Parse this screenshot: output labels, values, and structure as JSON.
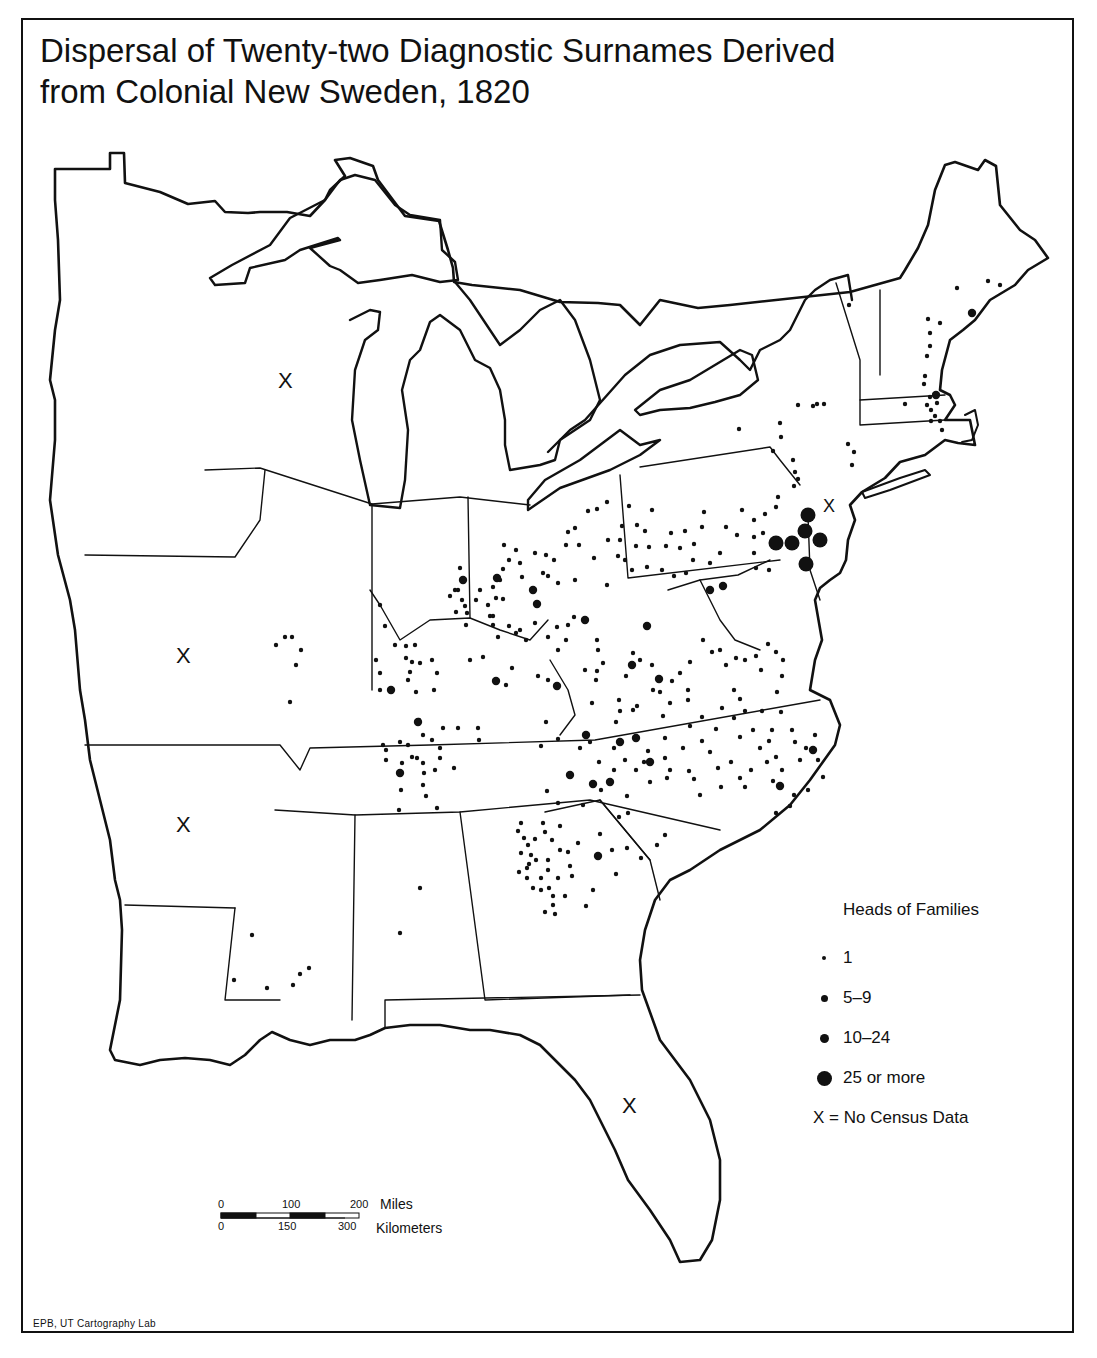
{
  "title": {
    "line1": "Dispersal of Twenty-two Diagnostic Surnames Derived",
    "line2": "from Colonial New Sweden, 1820"
  },
  "legend": {
    "title": "Heads of Families",
    "items": [
      {
        "label": "1",
        "size": 4
      },
      {
        "label": "5–9",
        "size": 7
      },
      {
        "label": "10–24",
        "size": 9
      },
      {
        "label": "25 or more",
        "size": 15
      }
    ],
    "no_data_note": "X = No Census Data"
  },
  "no_data_marker": "X",
  "no_data_regions": [
    {
      "name": "michigan-territory-west",
      "x": 286,
      "y": 381
    },
    {
      "name": "missouri",
      "x": 184,
      "y": 655
    },
    {
      "name": "arkansas-territory",
      "x": 184,
      "y": 824
    },
    {
      "name": "new-jersey",
      "x": 830,
      "y": 508
    },
    {
      "name": "florida",
      "x": 630,
      "y": 1105
    }
  ],
  "scale_bar": {
    "miles_ticks": [
      "0",
      "100",
      "200"
    ],
    "miles_label": "Miles",
    "km_ticks": [
      "0",
      "150",
      "300"
    ],
    "km_label": "Kilometers"
  },
  "credit": "EPB, UT Cartography Lab",
  "colors": {
    "ink": "#111111",
    "paper": "#ffffff"
  },
  "dots": {
    "large": [
      [
        805,
        531
      ],
      [
        820,
        540
      ],
      [
        806,
        564
      ],
      [
        792,
        543
      ],
      [
        776,
        543
      ],
      [
        808,
        515
      ]
    ],
    "medium": [
      [
        463,
        580
      ],
      [
        537,
        604
      ],
      [
        557,
        686
      ],
      [
        496,
        681
      ],
      [
        391,
        690
      ],
      [
        418,
        722
      ],
      [
        400,
        773
      ],
      [
        586,
        735
      ],
      [
        570,
        775
      ],
      [
        593,
        784
      ],
      [
        598,
        856
      ],
      [
        636,
        738
      ],
      [
        620,
        742
      ],
      [
        650,
        762
      ],
      [
        659,
        679
      ],
      [
        632,
        665
      ],
      [
        710,
        590
      ],
      [
        723,
        586
      ],
      [
        533,
        590
      ],
      [
        780,
        786
      ],
      [
        813,
        750
      ],
      [
        972,
        313
      ],
      [
        936,
        395
      ],
      [
        497,
        578
      ],
      [
        585,
        620
      ],
      [
        647,
        626
      ],
      [
        610,
        782
      ]
    ],
    "small": [
      [
        849,
        305
      ],
      [
        988,
        281
      ],
      [
        1000,
        285
      ],
      [
        957,
        288
      ],
      [
        928,
        319
      ],
      [
        940,
        323
      ],
      [
        930,
        333
      ],
      [
        930,
        346
      ],
      [
        927,
        356
      ],
      [
        925,
        376
      ],
      [
        924,
        384
      ],
      [
        930,
        397
      ],
      [
        927,
        405
      ],
      [
        937,
        403
      ],
      [
        931,
        410
      ],
      [
        935,
        416
      ],
      [
        931,
        421
      ],
      [
        940,
        421
      ],
      [
        942,
        430
      ],
      [
        905,
        404
      ],
      [
        798,
        405
      ],
      [
        813,
        406
      ],
      [
        824,
        404
      ],
      [
        817,
        404
      ],
      [
        739,
        429
      ],
      [
        780,
        423
      ],
      [
        781,
        437
      ],
      [
        773,
        451
      ],
      [
        848,
        444
      ],
      [
        854,
        452
      ],
      [
        852,
        465
      ],
      [
        793,
        460
      ],
      [
        795,
        472
      ],
      [
        794,
        486
      ],
      [
        798,
        479
      ],
      [
        629,
        506
      ],
      [
        622,
        526
      ],
      [
        637,
        525
      ],
      [
        620,
        540
      ],
      [
        636,
        546
      ],
      [
        649,
        547
      ],
      [
        645,
        531
      ],
      [
        652,
        510
      ],
      [
        671,
        533
      ],
      [
        685,
        531
      ],
      [
        704,
        512
      ],
      [
        726,
        527
      ],
      [
        742,
        510
      ],
      [
        754,
        520
      ],
      [
        737,
        535
      ],
      [
        754,
        537
      ],
      [
        754,
        553
      ],
      [
        756,
        568
      ],
      [
        769,
        570
      ],
      [
        763,
        533
      ],
      [
        765,
        514
      ],
      [
        776,
        507
      ],
      [
        778,
        497
      ],
      [
        666,
        546
      ],
      [
        680,
        548
      ],
      [
        694,
        544
      ],
      [
        702,
        527
      ],
      [
        720,
        553
      ],
      [
        693,
        560
      ],
      [
        710,
        563
      ],
      [
        686,
        573
      ],
      [
        674,
        576
      ],
      [
        662,
        570
      ],
      [
        647,
        567
      ],
      [
        632,
        570
      ],
      [
        625,
        560
      ],
      [
        607,
        502
      ],
      [
        597,
        509
      ],
      [
        588,
        511
      ],
      [
        575,
        528
      ],
      [
        568,
        532
      ],
      [
        566,
        545
      ],
      [
        579,
        545
      ],
      [
        594,
        558
      ],
      [
        608,
        540
      ],
      [
        618,
        556
      ],
      [
        607,
        585
      ],
      [
        575,
        580
      ],
      [
        558,
        583
      ],
      [
        548,
        576
      ],
      [
        516,
        550
      ],
      [
        504,
        545
      ],
      [
        509,
        560
      ],
      [
        520,
        563
      ],
      [
        535,
        553
      ],
      [
        546,
        555
      ],
      [
        554,
        560
      ],
      [
        543,
        573
      ],
      [
        522,
        577
      ],
      [
        503,
        569
      ],
      [
        500,
        580
      ],
      [
        493,
        587
      ],
      [
        496,
        598
      ],
      [
        488,
        605
      ],
      [
        490,
        616
      ],
      [
        503,
        599
      ],
      [
        493,
        616
      ],
      [
        509,
        626
      ],
      [
        520,
        630
      ],
      [
        535,
        623
      ],
      [
        526,
        640
      ],
      [
        557,
        627
      ],
      [
        548,
        637
      ],
      [
        568,
        625
      ],
      [
        574,
        617
      ],
      [
        566,
        640
      ],
      [
        558,
        650
      ],
      [
        516,
        633
      ],
      [
        498,
        637
      ],
      [
        493,
        625
      ],
      [
        476,
        600
      ],
      [
        480,
        590
      ],
      [
        462,
        600
      ],
      [
        458,
        590
      ],
      [
        465,
        606
      ],
      [
        456,
        612
      ],
      [
        460,
        568
      ],
      [
        462,
        580
      ],
      [
        455,
        590
      ],
      [
        450,
        596
      ],
      [
        467,
        613
      ],
      [
        466,
        625
      ],
      [
        380,
        605
      ],
      [
        385,
        626
      ],
      [
        395,
        645
      ],
      [
        376,
        660
      ],
      [
        406,
        646
      ],
      [
        406,
        658
      ],
      [
        415,
        645
      ],
      [
        412,
        662
      ],
      [
        420,
        663
      ],
      [
        432,
        660
      ],
      [
        437,
        673
      ],
      [
        410,
        672
      ],
      [
        408,
        680
      ],
      [
        416,
        692
      ],
      [
        380,
        673
      ],
      [
        380,
        690
      ],
      [
        285,
        637
      ],
      [
        292,
        637
      ],
      [
        276,
        645
      ],
      [
        296,
        665
      ],
      [
        290,
        702
      ],
      [
        301,
        650
      ],
      [
        597,
        640
      ],
      [
        598,
        650
      ],
      [
        585,
        670
      ],
      [
        597,
        671
      ],
      [
        603,
        663
      ],
      [
        596,
        680
      ],
      [
        592,
        703
      ],
      [
        619,
        700
      ],
      [
        620,
        711
      ],
      [
        616,
        722
      ],
      [
        633,
        710
      ],
      [
        637,
        706
      ],
      [
        653,
        690
      ],
      [
        660,
        692
      ],
      [
        672,
        681
      ],
      [
        670,
        703
      ],
      [
        663,
        716
      ],
      [
        688,
        700
      ],
      [
        688,
        690
      ],
      [
        690,
        726
      ],
      [
        702,
        717
      ],
      [
        716,
        729
      ],
      [
        722,
        708
      ],
      [
        734,
        690
      ],
      [
        740,
        699
      ],
      [
        734,
        718
      ],
      [
        745,
        711
      ],
      [
        753,
        730
      ],
      [
        740,
        737
      ],
      [
        762,
        711
      ],
      [
        772,
        730
      ],
      [
        781,
        712
      ],
      [
        777,
        692
      ],
      [
        782,
        676
      ],
      [
        783,
        660
      ],
      [
        776,
        652
      ],
      [
        768,
        644
      ],
      [
        761,
        670
      ],
      [
        756,
        656
      ],
      [
        745,
        660
      ],
      [
        736,
        658
      ],
      [
        726,
        665
      ],
      [
        720,
        650
      ],
      [
        712,
        652
      ],
      [
        703,
        640
      ],
      [
        690,
        662
      ],
      [
        680,
        673
      ],
      [
        652,
        665
      ],
      [
        640,
        660
      ],
      [
        633,
        653
      ],
      [
        626,
        676
      ],
      [
        546,
        722
      ],
      [
        548,
        680
      ],
      [
        538,
        676
      ],
      [
        512,
        668
      ],
      [
        506,
        685
      ],
      [
        483,
        657
      ],
      [
        470,
        660
      ],
      [
        434,
        690
      ],
      [
        419,
        720
      ],
      [
        432,
        740
      ],
      [
        443,
        728
      ],
      [
        423,
        735
      ],
      [
        458,
        728
      ],
      [
        478,
        728
      ],
      [
        479,
        740
      ],
      [
        440,
        748
      ],
      [
        440,
        758
      ],
      [
        435,
        770
      ],
      [
        454,
        768
      ],
      [
        437,
        808
      ],
      [
        426,
        796
      ],
      [
        423,
        785
      ],
      [
        424,
        773
      ],
      [
        417,
        758
      ],
      [
        408,
        745
      ],
      [
        400,
        742
      ],
      [
        383,
        745
      ],
      [
        402,
        763
      ],
      [
        412,
        757
      ],
      [
        423,
        763
      ],
      [
        401,
        790
      ],
      [
        399,
        810
      ],
      [
        386,
        760
      ],
      [
        386,
        750
      ],
      [
        541,
        746
      ],
      [
        558,
        739
      ],
      [
        580,
        748
      ],
      [
        590,
        742
      ],
      [
        599,
        762
      ],
      [
        614,
        748
      ],
      [
        625,
        760
      ],
      [
        614,
        770
      ],
      [
        636,
        770
      ],
      [
        644,
        762
      ],
      [
        648,
        751
      ],
      [
        665,
        738
      ],
      [
        665,
        758
      ],
      [
        667,
        778
      ],
      [
        650,
        782
      ],
      [
        670,
        770
      ],
      [
        683,
        748
      ],
      [
        689,
        771
      ],
      [
        694,
        779
      ],
      [
        702,
        741
      ],
      [
        710,
        752
      ],
      [
        718,
        768
      ],
      [
        721,
        787
      ],
      [
        700,
        795
      ],
      [
        731,
        762
      ],
      [
        740,
        778
      ],
      [
        745,
        787
      ],
      [
        751,
        770
      ],
      [
        760,
        748
      ],
      [
        769,
        741
      ],
      [
        776,
        757
      ],
      [
        782,
        770
      ],
      [
        773,
        781
      ],
      [
        792,
        730
      ],
      [
        795,
        742
      ],
      [
        800,
        760
      ],
      [
        806,
        748
      ],
      [
        815,
        735
      ],
      [
        818,
        760
      ],
      [
        823,
        777
      ],
      [
        808,
        790
      ],
      [
        776,
        813
      ],
      [
        790,
        806
      ],
      [
        794,
        795
      ],
      [
        767,
        762
      ],
      [
        547,
        791
      ],
      [
        558,
        803
      ],
      [
        583,
        805
      ],
      [
        601,
        790
      ],
      [
        619,
        817
      ],
      [
        628,
        813
      ],
      [
        627,
        796
      ],
      [
        600,
        834
      ],
      [
        560,
        826
      ],
      [
        578,
        843
      ],
      [
        612,
        850
      ],
      [
        627,
        848
      ],
      [
        657,
        845
      ],
      [
        665,
        835
      ],
      [
        641,
        858
      ],
      [
        616,
        874
      ],
      [
        593,
        890
      ],
      [
        586,
        906
      ],
      [
        558,
        878
      ],
      [
        572,
        876
      ],
      [
        518,
        831
      ],
      [
        524,
        838
      ],
      [
        528,
        845
      ],
      [
        521,
        853
      ],
      [
        531,
        855
      ],
      [
        536,
        860
      ],
      [
        527,
        868
      ],
      [
        519,
        872
      ],
      [
        527,
        878
      ],
      [
        533,
        888
      ],
      [
        541,
        890
      ],
      [
        541,
        878
      ],
      [
        548,
        870
      ],
      [
        549,
        888
      ],
      [
        553,
        896
      ],
      [
        553,
        905
      ],
      [
        545,
        912
      ],
      [
        548,
        860
      ],
      [
        560,
        850
      ],
      [
        552,
        840
      ],
      [
        535,
        839
      ],
      [
        545,
        832
      ],
      [
        543,
        823
      ],
      [
        521,
        823
      ],
      [
        529,
        864
      ],
      [
        568,
        852
      ],
      [
        570,
        866
      ],
      [
        565,
        896
      ],
      [
        555,
        914
      ],
      [
        420,
        888
      ],
      [
        400,
        933
      ],
      [
        309,
        968
      ],
      [
        300,
        974
      ],
      [
        293,
        985
      ],
      [
        267,
        988
      ],
      [
        252,
        935
      ],
      [
        234,
        980
      ]
    ]
  }
}
